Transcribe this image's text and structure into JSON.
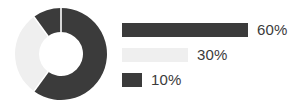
{
  "chart_data": {
    "type": "pie",
    "title": "",
    "subtitle": "",
    "xlabel": "",
    "ylabel": "",
    "variant": "donut",
    "grid": false,
    "legend_position": "right",
    "total": 100,
    "unit": "%",
    "start_angle_deg": 0,
    "direction": "clockwise",
    "categories": [
      "60%",
      "30%",
      "10%"
    ],
    "values": [
      60,
      30,
      10
    ],
    "colors": [
      "#3b3b3b",
      "#efefef",
      "#3b3b3b"
    ],
    "slices": [
      {
        "label": "60%",
        "value": 60,
        "color": "#3b3b3b",
        "start_deg": 0,
        "end_deg": 216
      },
      {
        "label": "30%",
        "value": 30,
        "color": "#efefef",
        "start_deg": 216,
        "end_deg": 324
      },
      {
        "label": "10%",
        "value": 10,
        "color": "#3b3b3b",
        "start_deg": 324,
        "end_deg": 360
      }
    ],
    "legend": [
      {
        "label": "60%",
        "value": 60,
        "color": "#3b3b3b",
        "bar_length_px": 126
      },
      {
        "label": "30%",
        "value": 30,
        "color": "#efefef",
        "bar_length_px": 66
      },
      {
        "label": "10%",
        "value": 10,
        "color": "#3b3b3b",
        "bar_length_px": 20
      }
    ]
  },
  "donut": {
    "center_x": 47,
    "center_y": 47,
    "outer_radius": 46,
    "inner_radius": 22,
    "separator_color": "#ffffff"
  },
  "palette": {
    "background": "#ffffff",
    "dark": "#3b3b3b",
    "light": "#efefef",
    "text": "#3b3b3b"
  }
}
